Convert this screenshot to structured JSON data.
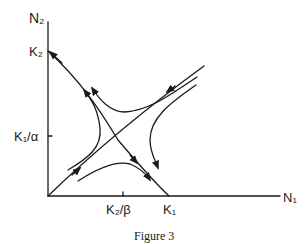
{
  "figure": {
    "caption": "Figure 3",
    "axes": {
      "y_label": "N₂",
      "x_label": "N₁"
    },
    "y_ticks": [
      {
        "label": "K₂",
        "pos": "top intercept of descending isocline"
      },
      {
        "label": "K₁/α",
        "pos": "mid y-axis"
      }
    ],
    "x_ticks": [
      {
        "label": "K₂/β",
        "pos": "mid x-axis"
      },
      {
        "label": "K₁",
        "pos": "x intercept of descending isocline"
      }
    ]
  },
  "colors": {
    "ink": "#1a1a1a",
    "background": "#ffffff"
  }
}
